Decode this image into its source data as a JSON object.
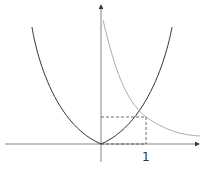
{
  "diagram": {
    "x_tick_label": "1",
    "colors": {
      "axis": "#555555",
      "parabola": "#333333",
      "hyperbola": "#999999",
      "dashed": "#444444"
    }
  }
}
